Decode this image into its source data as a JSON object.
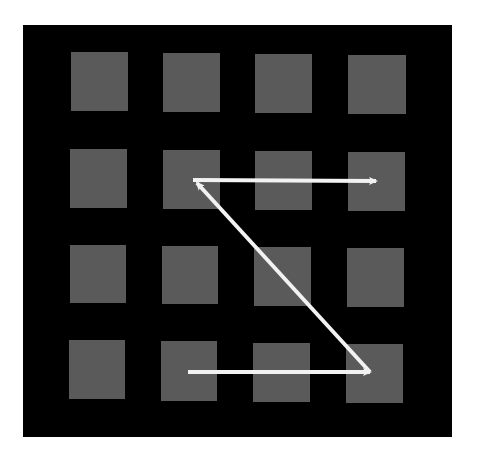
{
  "diagram": {
    "title": "",
    "colors": {
      "background": "#ffffff",
      "panel": "#000000",
      "cell": "#5a5a5a",
      "arrow": "#f2f2f2"
    },
    "panel": {
      "x": 23,
      "y": 25,
      "w": 429,
      "h": 412
    },
    "grid": {
      "rows": 4,
      "cols": 4,
      "cells": [
        {
          "row": 1,
          "col": 1,
          "x": 71,
          "y": 52,
          "w": 57,
          "h": 59
        },
        {
          "row": 1,
          "col": 2,
          "x": 163,
          "y": 53,
          "w": 57,
          "h": 59
        },
        {
          "row": 1,
          "col": 3,
          "x": 255,
          "y": 54,
          "w": 57,
          "h": 59
        },
        {
          "row": 1,
          "col": 4,
          "x": 348,
          "y": 55,
          "w": 58,
          "h": 59
        },
        {
          "row": 2,
          "col": 1,
          "x": 70,
          "y": 149,
          "w": 57,
          "h": 59
        },
        {
          "row": 2,
          "col": 2,
          "x": 163,
          "y": 150,
          "w": 57,
          "h": 59
        },
        {
          "row": 2,
          "col": 3,
          "x": 255,
          "y": 151,
          "w": 57,
          "h": 59
        },
        {
          "row": 2,
          "col": 4,
          "x": 348,
          "y": 152,
          "w": 57,
          "h": 59
        },
        {
          "row": 3,
          "col": 1,
          "x": 70,
          "y": 245,
          "w": 56,
          "h": 58
        },
        {
          "row": 3,
          "col": 2,
          "x": 162,
          "y": 246,
          "w": 56,
          "h": 58
        },
        {
          "row": 3,
          "col": 3,
          "x": 254,
          "y": 247,
          "w": 57,
          "h": 59
        },
        {
          "row": 3,
          "col": 4,
          "x": 347,
          "y": 248,
          "w": 57,
          "h": 59
        },
        {
          "row": 4,
          "col": 1,
          "x": 69,
          "y": 340,
          "w": 56,
          "h": 59
        },
        {
          "row": 4,
          "col": 2,
          "x": 161,
          "y": 341,
          "w": 56,
          "h": 60
        },
        {
          "row": 4,
          "col": 3,
          "x": 253,
          "y": 343,
          "w": 57,
          "h": 59
        },
        {
          "row": 4,
          "col": 4,
          "x": 346,
          "y": 344,
          "w": 57,
          "h": 59
        }
      ]
    },
    "arrows": [
      {
        "name": "bottom-arrow",
        "from": [
          188,
          372
        ],
        "to": [
          370,
          372
        ],
        "description": "row 4: col 2 → col 4"
      },
      {
        "name": "diagonal-arrow",
        "from": [
          370,
          372
        ],
        "to": [
          197,
          183
        ],
        "description": "row 4 col 4 → row 2 col 2"
      },
      {
        "name": "top-arrow",
        "from": [
          193,
          180
        ],
        "to": [
          376,
          181
        ],
        "description": "row 2: col 2 → col 4"
      }
    ],
    "path_description": "Z-shaped scan path across 4x4 grid"
  }
}
